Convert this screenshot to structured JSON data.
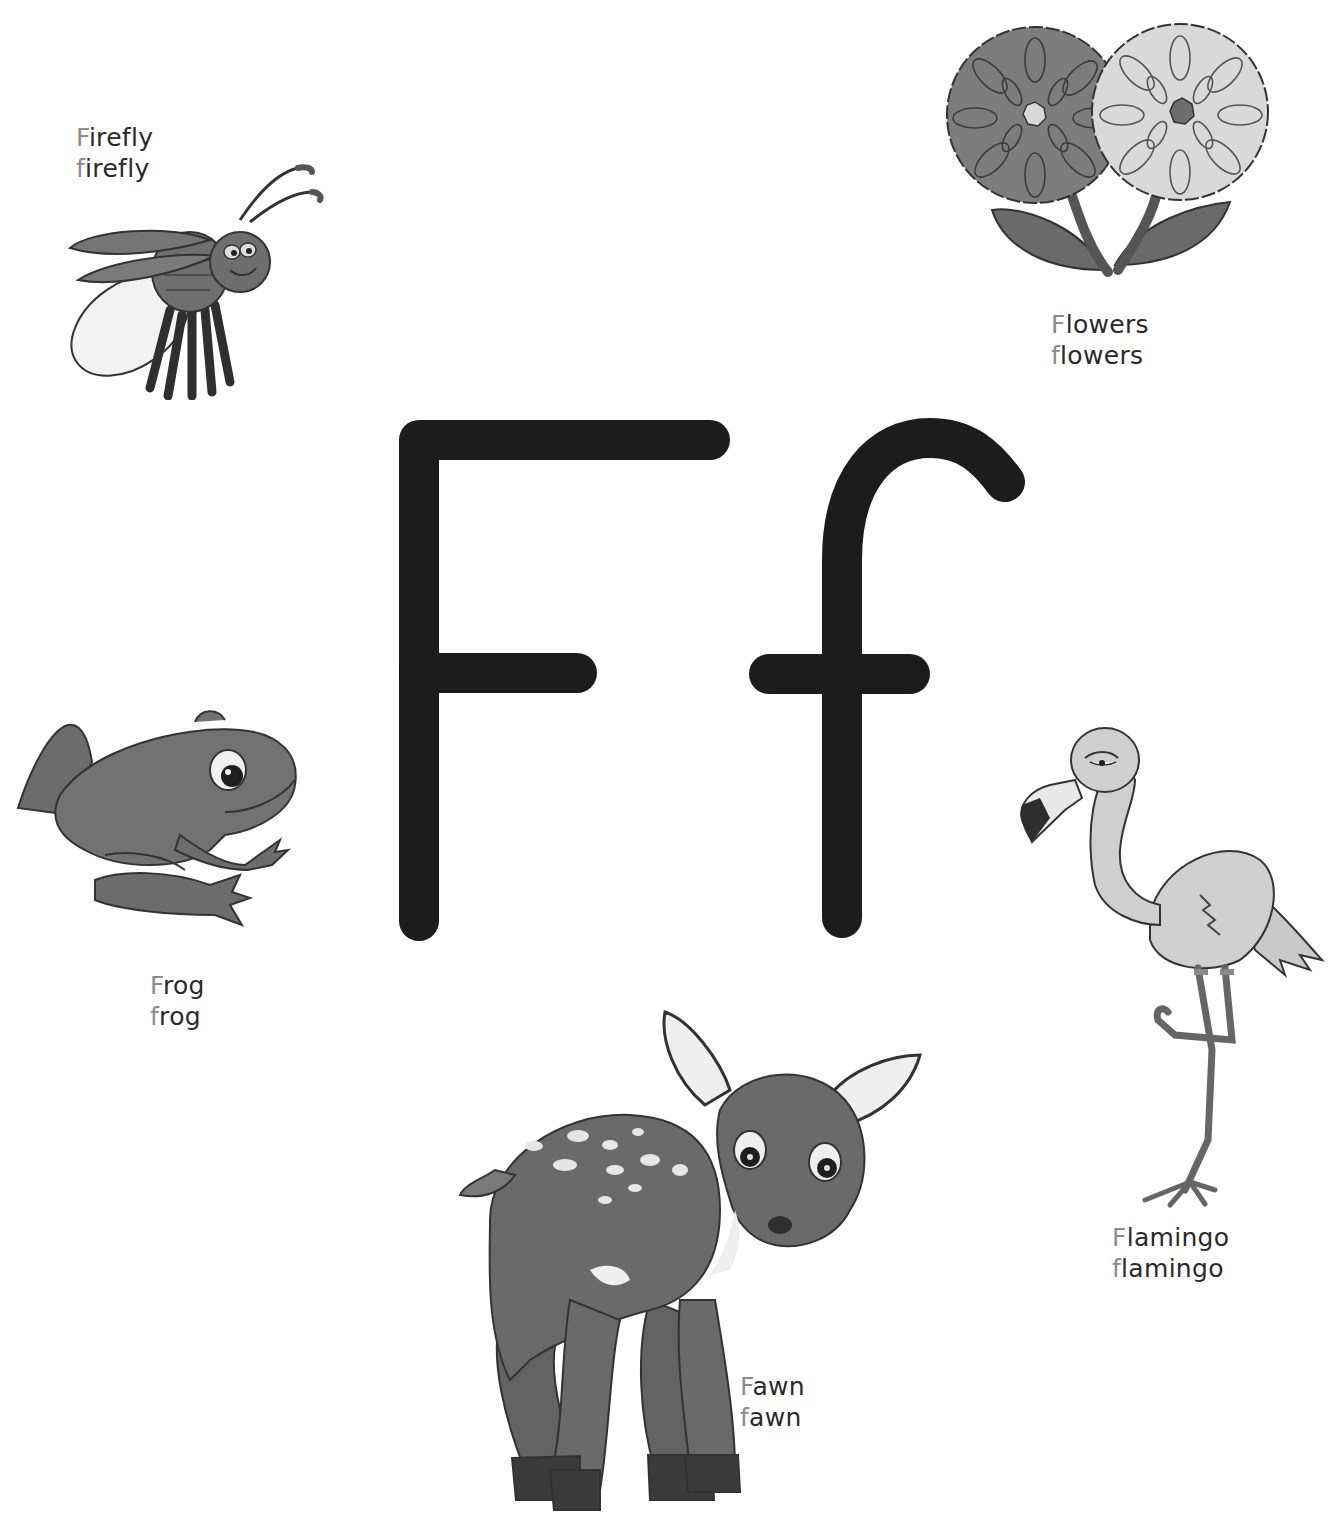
{
  "page": {
    "letter_upper": "F",
    "letter_lower": "f",
    "letter_color": "#1c1c1c",
    "initial_color": "#8c8c8c",
    "text_color": "#2a2a2a"
  },
  "items": [
    {
      "id": "firefly",
      "upper_initial": "F",
      "upper_rest": "irefly",
      "lower_initial": "f",
      "lower_rest": "irefly",
      "icon": "firefly-illustration"
    },
    {
      "id": "flowers",
      "upper_initial": "F",
      "upper_rest": "lowers",
      "lower_initial": "f",
      "lower_rest": "lowers",
      "icon": "flowers-illustration"
    },
    {
      "id": "frog",
      "upper_initial": "F",
      "upper_rest": "rog",
      "lower_initial": "f",
      "lower_rest": "rog",
      "icon": "frog-illustration"
    },
    {
      "id": "flamingo",
      "upper_initial": "F",
      "upper_rest": "lamingo",
      "lower_initial": "f",
      "lower_rest": "lamingo",
      "icon": "flamingo-illustration"
    },
    {
      "id": "fawn",
      "upper_initial": "F",
      "upper_rest": "awn",
      "lower_initial": "f",
      "lower_rest": "awn",
      "icon": "fawn-illustration"
    }
  ]
}
